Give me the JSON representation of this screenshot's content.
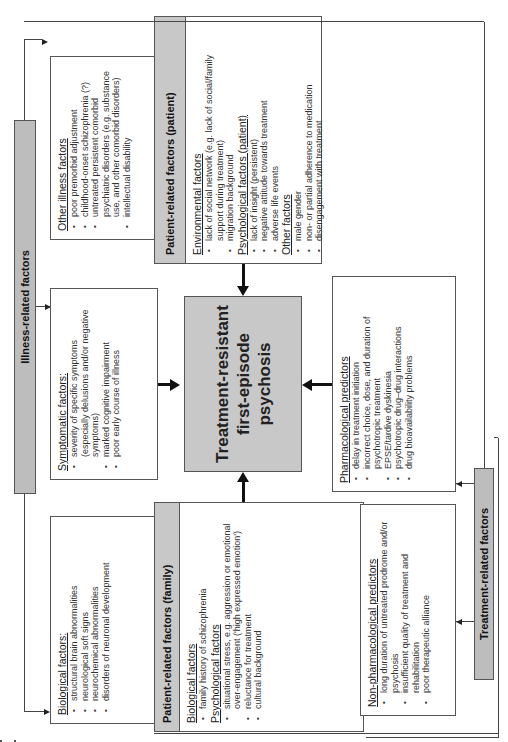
{
  "illness_bar": {
    "label": "Illness-related factors"
  },
  "treatment_bar": {
    "label": "Treatment-related factors"
  },
  "center": {
    "line1": "Treatment-resistant",
    "line2": "first-episode",
    "line3": "psychosis"
  },
  "other_illness": {
    "title": "Other illness factors",
    "items": [
      "poor premorbid adjustment",
      "childhood-onset schizophrenia (?)",
      "untreated persistent comorbid psychiatric disorders (e.g. substance use, and other comorbid disorders)",
      "intellectual disability"
    ]
  },
  "symptomatic": {
    "title": "Symptomatic factors:",
    "items": [
      "severity of specific symptoms (especially delusions and/or negative symptoms)",
      "marked cognitive impairment",
      "poor early course of illness"
    ]
  },
  "biological": {
    "title": "Biological factors:",
    "items": [
      "structural brain abnormalities",
      "neurological soft signs",
      "neurochemical abnormalities",
      "disorders of neuronal development"
    ]
  },
  "patient_patient": {
    "header": "Patient-related factors (patient)",
    "sections": [
      {
        "title": "Environmental factors",
        "items": [
          "lack of social network (e.g. lack of social/family support during treatment)",
          "migration background"
        ]
      },
      {
        "title": "Psychological factors (patient)",
        "items": [
          "lack of insight (persistent)",
          "negative attitude towards treatment",
          "adverse life events"
        ]
      },
      {
        "title": "Other factors",
        "items": [
          "male gender",
          "non- or partial adherence to medication",
          "disengagement with treatment"
        ]
      }
    ]
  },
  "patient_family": {
    "header": "Patient-related factors (family)",
    "sections": [
      {
        "title": "Biological factors",
        "items": [
          "family history of schizophrenia"
        ]
      },
      {
        "title": "Psychological factors",
        "items": [
          "situational stress, e.g. aggression or emotional over-engagement ('high expressed emotion')",
          "reluctance for treatment",
          "cultural background"
        ]
      }
    ]
  },
  "pharmacological": {
    "title": "Pharmacological predictors",
    "items": [
      "delay in treatment initiation",
      "incorrect choice, dose, and duration of psychotropic treatment",
      "EPSE/tardive dyskinesia",
      "psychotropic drug–drug interactions",
      "drug bioavailability problems"
    ]
  },
  "non_pharmacological": {
    "title": "Non-pharmacological predictors",
    "items": [
      "long duration of untreated prodrome and/or psychosis",
      "insufficient quality of treatment and rehabilitation",
      "poor therapeutic alliance"
    ]
  }
}
